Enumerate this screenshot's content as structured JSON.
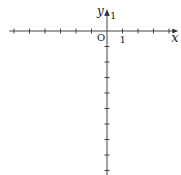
{
  "diagram": {
    "type": "coordinate-axes",
    "x_axis_label": "x",
    "y_axis_label": "y",
    "origin_label": "O",
    "x_unit_label": "1",
    "y_unit_label": "1",
    "x_ticks": [
      -6,
      -5,
      -4,
      -3,
      -2,
      -1,
      1,
      2,
      3,
      4
    ],
    "y_ticks": [
      1,
      -1,
      -2,
      -3,
      -4,
      -5,
      -6,
      -7,
      -8,
      -9
    ],
    "x_range": [
      -6.3,
      4.6
    ],
    "y_range": [
      -9.3,
      1.4
    ],
    "axis_color": "#444444"
  }
}
